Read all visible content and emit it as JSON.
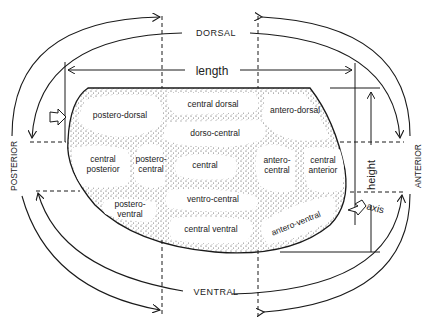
{
  "diagram": {
    "colors": {
      "ink": "#1a1a1a",
      "stipple": "#555555",
      "background": "#ffffff"
    },
    "orientation": {
      "top": "DORSAL",
      "bottom": "VENTRAL",
      "left": "POSTERIOR",
      "right": "ANTERIOR"
    },
    "measurements": {
      "length": "length",
      "height": "height",
      "axis": "axis"
    },
    "regions": [
      {
        "id": "postero-dorsal",
        "lines": [
          "postero-dorsal"
        ]
      },
      {
        "id": "central-dorsal",
        "lines": [
          "central dorsal"
        ]
      },
      {
        "id": "antero-dorsal",
        "lines": [
          "antero-dorsal"
        ]
      },
      {
        "id": "dorso-central",
        "lines": [
          "dorso-central"
        ]
      },
      {
        "id": "central-posterior",
        "lines": [
          "central",
          "posterior"
        ]
      },
      {
        "id": "postero-central",
        "lines": [
          "postero-",
          "central"
        ]
      },
      {
        "id": "central",
        "lines": [
          "central"
        ]
      },
      {
        "id": "antero-central",
        "lines": [
          "antero-",
          "central"
        ]
      },
      {
        "id": "central-anterior",
        "lines": [
          "central",
          "anterior"
        ]
      },
      {
        "id": "postero-ventral",
        "lines": [
          "postero-",
          "ventral"
        ]
      },
      {
        "id": "ventro-central",
        "lines": [
          "ventro-central"
        ]
      },
      {
        "id": "central-ventral",
        "lines": [
          "central ventral"
        ]
      },
      {
        "id": "antero-ventral",
        "lines": [
          "antero-ventral"
        ]
      }
    ]
  }
}
